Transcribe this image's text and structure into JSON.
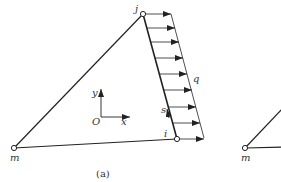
{
  "figure": {
    "caption": "(a)",
    "nodes": {
      "j": "j",
      "i": "i",
      "m": "m"
    },
    "load_label": "q",
    "edge_coord_label": "s",
    "axes": {
      "origin": "O",
      "x": "x",
      "y": "y"
    },
    "second_figure": {
      "node_m": "m"
    }
  },
  "colors": {
    "stroke": "#222222",
    "background": "#ffffff"
  }
}
